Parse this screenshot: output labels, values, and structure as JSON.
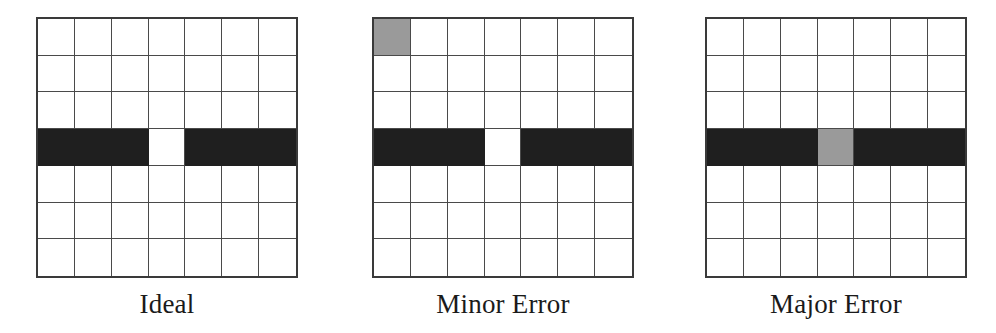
{
  "figure": {
    "grid_size": {
      "rows": 7,
      "cols": 7
    },
    "colors": {
      "background": "#ffffff",
      "grid_line": "#4a4a4a",
      "black_cell": "#1f1f1f",
      "gray_cell": "#9a9a9a"
    },
    "panels": [
      {
        "label": "Ideal",
        "black_row": 3,
        "black_row_gap_col": 3,
        "gray_cells": []
      },
      {
        "label": "Minor Error",
        "black_row": 3,
        "black_row_gap_col": 3,
        "gray_cells": [
          {
            "row": 0,
            "col": 0
          }
        ]
      },
      {
        "label": "Major Error",
        "black_row": 3,
        "black_row_gap_col": 3,
        "gray_cells": [
          {
            "row": 3,
            "col": 3
          }
        ]
      }
    ]
  }
}
